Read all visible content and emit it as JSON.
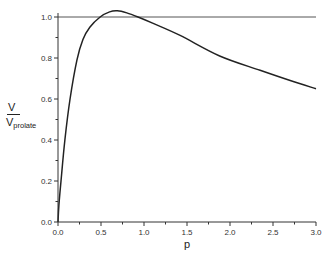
{
  "chart_data": {
    "type": "line",
    "title": "",
    "xlabel": "p",
    "ylabel": "V / V_prolate",
    "ylabel_parts": {
      "numerator": "V",
      "denominator": "V",
      "denominator_sub": "prolate"
    },
    "xlim": [
      0.0,
      3.0
    ],
    "ylim": [
      0.0,
      1.05
    ],
    "x_ticks": [
      "0.0",
      "0.5",
      "1.0",
      "1.5",
      "2.0",
      "2.5",
      "3.0"
    ],
    "y_ticks": [
      "0.0",
      "0.2",
      "0.4",
      "0.6",
      "0.8",
      "1.0"
    ],
    "grid": false,
    "legend": null,
    "reference_line": {
      "y": 1.0,
      "label": "V = V_prolate"
    },
    "series": [
      {
        "name": "V/V_prolate",
        "x": [
          0.0,
          0.01,
          0.035,
          0.08,
          0.14,
          0.22,
          0.29,
          0.37,
          0.49,
          0.6,
          0.69,
          0.8,
          0.93,
          1.1,
          1.42,
          1.88,
          2.35,
          2.7,
          3.0
        ],
        "y": [
          0.0,
          0.08,
          0.2,
          0.4,
          0.6,
          0.79,
          0.89,
          0.95,
          1.0,
          1.025,
          1.03,
          1.02,
          1.0,
          0.97,
          0.91,
          0.81,
          0.74,
          0.69,
          0.65
        ]
      }
    ]
  }
}
